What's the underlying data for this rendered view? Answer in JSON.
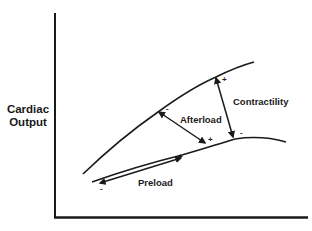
{
  "diagram": {
    "type": "frank-starling-cardiac-output-curves",
    "y_axis": {
      "label_line1": "Cardiac",
      "label_line2": "Output"
    },
    "x_axis": {
      "label": "(cut off, not legible)"
    },
    "curves": [
      {
        "name": "upper-curve"
      },
      {
        "name": "lower-curve"
      }
    ],
    "arrows": {
      "preload": {
        "label": "Preload",
        "minus": "-",
        "plus": "+"
      },
      "afterload": {
        "label": "Afterload",
        "minus": "-",
        "plus": "+"
      },
      "contractility": {
        "label": "Contractility",
        "minus": "-",
        "plus": "+"
      }
    },
    "colors": {
      "ink": "#1a1a1a",
      "background": "#ffffff"
    }
  }
}
